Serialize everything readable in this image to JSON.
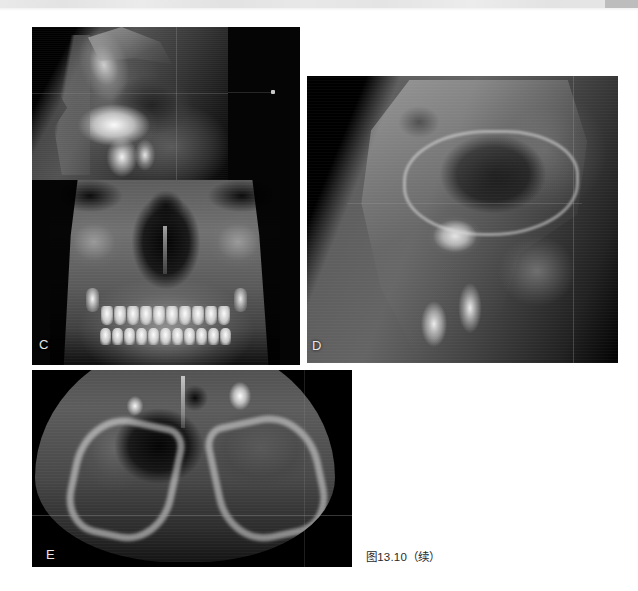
{
  "page": {
    "background_color": "#ffffff",
    "width": 638,
    "height": 591
  },
  "scanner_band": {
    "name": "scan-edge-band",
    "color": "#e7e7e7",
    "accent_color": "#bdbdbd"
  },
  "figure": {
    "caption": "图13.10（续）",
    "panels": [
      {
        "label": "C",
        "modality": "CBCT",
        "views": [
          "sagittal slice",
          "3D volume rendering frontal view"
        ],
        "description": "矢状面断层及三维重建正面观"
      },
      {
        "label": "D",
        "modality": "CBCT",
        "views": [
          "sagittal slice"
        ],
        "description": "上颌窦区矢状面断层"
      },
      {
        "label": "E",
        "modality": "CBCT",
        "views": [
          "axial slice"
        ],
        "description": "上颌轴位断层"
      }
    ]
  }
}
